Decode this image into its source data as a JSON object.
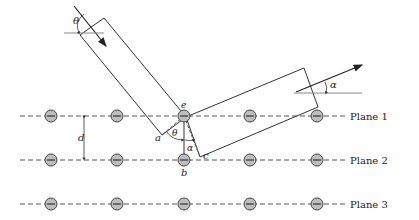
{
  "figure": {
    "planes": [
      {
        "label": "Plane 1",
        "y": 116
      },
      {
        "label": "Plane 2",
        "y": 160
      },
      {
        "label": "Plane 3",
        "y": 204
      }
    ],
    "atom_x": [
      51,
      117,
      184,
      250,
      317
    ],
    "labels": {
      "theta_incident": "θ",
      "alpha_reflected": "α",
      "theta_inner": "θ",
      "alpha_inner": "α",
      "spacing": "d",
      "point_a": "a",
      "point_b": "b",
      "point_c": "c",
      "point_e": "e"
    },
    "colors": {
      "line": "#333333",
      "dashed": "#555555",
      "atom_fill": "#bdbdbd",
      "atom_stroke": "#444444",
      "guide": "#888888"
    }
  }
}
